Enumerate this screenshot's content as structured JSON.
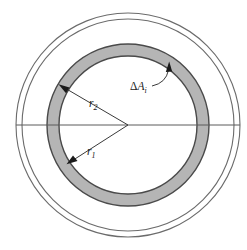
{
  "figure": {
    "type": "geometry-diagram",
    "background_color": "#ffffff",
    "width": 247,
    "height": 250
  },
  "labels": {
    "inner_radius": {
      "symbol": "r",
      "subscript": "1",
      "text": "r"
    },
    "outer_radius": {
      "symbol": "r",
      "subscript": "2",
      "text": "r"
    },
    "area_element": {
      "delta": "Δ",
      "symbol": "A",
      "subscript": "i",
      "text": "ΔA"
    }
  },
  "geometry": {
    "center": {
      "x": 128,
      "y": 125
    },
    "outer_circle_1_radius": 112,
    "outer_circle_2_radius": 106,
    "band_outer_radius": 81,
    "band_inner_radius": 69,
    "horizontal_line": {
      "x1": 16,
      "x2": 240,
      "y": 125
    }
  },
  "colors": {
    "band_fill": "#b5b5b5",
    "band_stroke": "#4a4a4a",
    "thin_circle_stroke": "#6b6b6b",
    "leader_line": "#3a3a3a",
    "axis_line": "#5a5a5a",
    "text": "#1a1a1a"
  },
  "annotations": {
    "r1_arrow": {
      "from": {
        "x": 128,
        "y": 125
      },
      "to": {
        "x": 69,
        "y": 163
      }
    },
    "r2_arrow": {
      "from": {
        "x": 128,
        "y": 125
      },
      "to": {
        "x": 62,
        "y": 86
      }
    },
    "area_arrow": {
      "from": {
        "x": 155,
        "y": 84
      },
      "to": {
        "x": 169,
        "y": 66
      }
    }
  }
}
